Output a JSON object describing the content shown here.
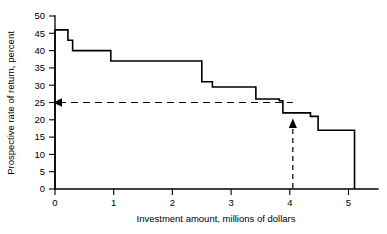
{
  "chart_data": {
    "type": "area",
    "title": "",
    "xlabel": "Investment amount, millions of dollars",
    "ylabel": "Prospective rate of return, percent",
    "xlim": [
      0,
      5.5
    ],
    "ylim": [
      0,
      50
    ],
    "xticks": [
      0,
      1,
      2,
      3,
      4,
      5
    ],
    "xtick_labels": [
      "0",
      "1",
      "2",
      "3",
      "4",
      "5"
    ],
    "yticks": [
      0,
      5,
      10,
      15,
      20,
      25,
      30,
      35,
      40,
      45,
      50
    ],
    "ytick_labels": [
      "0",
      "5",
      "10",
      "15",
      "20",
      "25",
      "30",
      "35",
      "40",
      "45",
      "50"
    ],
    "grid": false,
    "legend": "none",
    "series_name": "Prospective rate of return",
    "steps": [
      {
        "x_start": 0.0,
        "x_end": 0.22,
        "rate": 46.0
      },
      {
        "x_start": 0.22,
        "x_end": 0.3,
        "rate": 43.0
      },
      {
        "x_start": 0.3,
        "x_end": 0.95,
        "rate": 40.0
      },
      {
        "x_start": 0.95,
        "x_end": 2.5,
        "rate": 37.0
      },
      {
        "x_start": 2.5,
        "x_end": 2.68,
        "rate": 31.0
      },
      {
        "x_start": 2.68,
        "x_end": 3.42,
        "rate": 29.5
      },
      {
        "x_start": 3.42,
        "x_end": 3.82,
        "rate": 26.0
      },
      {
        "x_start": 3.82,
        "x_end": 3.88,
        "rate": 25.5
      },
      {
        "x_start": 3.88,
        "x_end": 4.35,
        "rate": 22.0
      },
      {
        "x_start": 4.35,
        "x_end": 4.48,
        "rate": 21.0
      },
      {
        "x_start": 4.48,
        "x_end": 5.1,
        "rate": 17.0
      }
    ],
    "annotations": [
      {
        "name": "cutoff-rate-line",
        "kind": "horizontal-dashed-line",
        "y": 25,
        "x_from": 0.0,
        "x_to": 4.05,
        "marker": "left-arrow-at-axis",
        "label": ""
      },
      {
        "name": "investment-level-pointer",
        "kind": "vertical-dashed-arrow",
        "x": 4.05,
        "y_from": 0,
        "y_to": 22,
        "direction": "up",
        "label": ""
      }
    ]
  }
}
